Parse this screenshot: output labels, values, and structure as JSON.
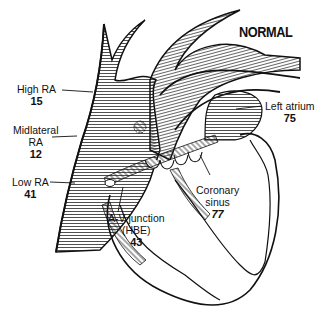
{
  "title": "NORMAL",
  "labels": [
    {
      "id": "high-ra",
      "name": "High RA",
      "value": "15"
    },
    {
      "id": "midlateral-ra",
      "name_line1": "Midlateral",
      "name_line2": "RA",
      "value": "12"
    },
    {
      "id": "low-ra",
      "name": "Low RA",
      "value": "41"
    },
    {
      "id": "av-junction",
      "name_line1": "A-V junction",
      "name_line2": "(HBE)",
      "value": "43"
    },
    {
      "id": "coronary-sinus",
      "name_line1": "Coronary",
      "name_line2": "sinus",
      "value": "77"
    },
    {
      "id": "left-atrium",
      "name": "Left atrium",
      "value": "75"
    }
  ],
  "colors": {
    "ink": "#111111",
    "background": "#ffffff",
    "hatch": "#333333"
  }
}
